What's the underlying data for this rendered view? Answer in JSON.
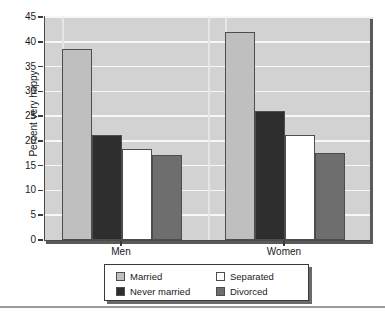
{
  "chart_data": {
    "type": "bar",
    "title": "",
    "xlabel": "",
    "ylabel": "Percent very happy",
    "categories": [
      "Men",
      "Women"
    ],
    "series": [
      {
        "name": "Married",
        "values": [
          38.5,
          41.9
        ],
        "color": "#bfbfbf"
      },
      {
        "name": "Never married",
        "values": [
          21.2,
          26.0
        ],
        "color": "#2e2e2e"
      },
      {
        "name": "Separated",
        "values": [
          18.3,
          21.2
        ],
        "color": "#ffffff"
      },
      {
        "name": "Divorced",
        "values": [
          17.1,
          17.5
        ],
        "color": "#6e6e6e"
      }
    ],
    "ylim": [
      0,
      45
    ],
    "yticks": [
      0,
      5,
      10,
      15,
      20,
      25,
      30,
      35,
      40,
      45
    ],
    "ytick_labels": [
      "0",
      "5",
      "10",
      "15",
      "20",
      "25",
      "30",
      "35",
      "40",
      "45"
    ],
    "grid": true,
    "legend_position": "bottom",
    "plot_background": "#d2d2d2",
    "gridline_color": "#f7f7f7",
    "axis_color": "#4a4a4a"
  },
  "legend": {
    "entries": [
      {
        "label": "Married"
      },
      {
        "label": "Separated"
      },
      {
        "label": "Never married"
      },
      {
        "label": "Divorced"
      }
    ]
  }
}
